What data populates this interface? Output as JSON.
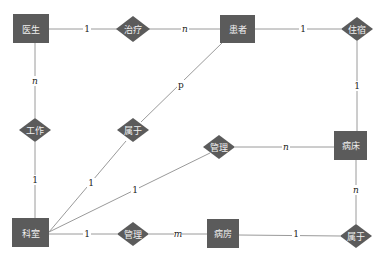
{
  "diagram": {
    "type": "er-diagram",
    "colors": {
      "entity_fill": "#5b5b5b",
      "relationship_fill": "#5b5b5b",
      "label_text": "#f0f0f0",
      "line": "#9a9a9a",
      "cardinality_text": "#222222"
    },
    "entities": [
      {
        "id": "doctor",
        "label": "医生",
        "x": 31,
        "y": 29
      },
      {
        "id": "patient",
        "label": "患者",
        "x": 237,
        "y": 29
      },
      {
        "id": "bed",
        "label": "病床",
        "x": 350,
        "y": 145
      },
      {
        "id": "department",
        "label": "科室",
        "x": 31,
        "y": 233
      },
      {
        "id": "ward",
        "label": "病房",
        "x": 223,
        "y": 233
      }
    ],
    "relationships": [
      {
        "id": "treat",
        "label": "治疗",
        "x": 133,
        "y": 29
      },
      {
        "id": "stay",
        "label": "住宿",
        "x": 357,
        "y": 29
      },
      {
        "id": "work",
        "label": "工作",
        "x": 35,
        "y": 130
      },
      {
        "id": "belong_patient",
        "label": "属于",
        "x": 133,
        "y": 130
      },
      {
        "id": "manage_bed",
        "label": "管理",
        "x": 219,
        "y": 147
      },
      {
        "id": "manage_ward",
        "label": "管理",
        "x": 133,
        "y": 234
      },
      {
        "id": "belong_ward",
        "label": "属于",
        "x": 356,
        "y": 236
      }
    ],
    "connections": [
      {
        "from": "doctor",
        "to": "treat",
        "cardinality": "1"
      },
      {
        "from": "treat",
        "to": "patient",
        "cardinality": "n"
      },
      {
        "from": "patient",
        "to": "stay",
        "cardinality": "1"
      },
      {
        "from": "stay",
        "to": "bed",
        "cardinality": "1"
      },
      {
        "from": "doctor",
        "to": "work",
        "cardinality": "n"
      },
      {
        "from": "work",
        "to": "department",
        "cardinality": "1"
      },
      {
        "from": "patient",
        "to": "belong_patient",
        "cardinality": "p"
      },
      {
        "from": "belong_patient",
        "to": "department",
        "cardinality": "1"
      },
      {
        "from": "department",
        "to": "manage_bed",
        "cardinality": "1"
      },
      {
        "from": "manage_bed",
        "to": "bed",
        "cardinality": "n"
      },
      {
        "from": "bed",
        "to": "belong_ward",
        "cardinality": "n"
      },
      {
        "from": "department",
        "to": "manage_ward",
        "cardinality": "1"
      },
      {
        "from": "manage_ward",
        "to": "ward",
        "cardinality": "m"
      },
      {
        "from": "ward",
        "to": "belong_ward",
        "cardinality": "1"
      }
    ],
    "cardinality_labels": [
      {
        "text": "1",
        "x": 87,
        "y": 29,
        "italic": false
      },
      {
        "text": "n",
        "x": 185,
        "y": 29,
        "italic": true
      },
      {
        "text": "1",
        "x": 303,
        "y": 29,
        "italic": false
      },
      {
        "text": "1",
        "x": 357,
        "y": 86,
        "italic": false
      },
      {
        "text": "n",
        "x": 35,
        "y": 81,
        "italic": true
      },
      {
        "text": "1",
        "x": 35,
        "y": 180,
        "italic": false
      },
      {
        "text": "p",
        "x": 181,
        "y": 85,
        "italic": false
      },
      {
        "text": "1",
        "x": 91,
        "y": 183,
        "italic": false
      },
      {
        "text": "1",
        "x": 135,
        "y": 190,
        "italic": false
      },
      {
        "text": "n",
        "x": 286,
        "y": 147,
        "italic": true
      },
      {
        "text": "n",
        "x": 356,
        "y": 190,
        "italic": true
      },
      {
        "text": "1",
        "x": 87,
        "y": 234,
        "italic": false
      },
      {
        "text": "m",
        "x": 178,
        "y": 234,
        "italic": true
      },
      {
        "text": "1",
        "x": 296,
        "y": 234,
        "italic": false
      }
    ]
  }
}
